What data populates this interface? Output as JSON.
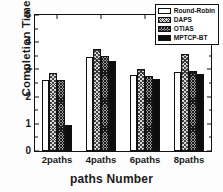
{
  "chart_data": {
    "type": "bar",
    "title": "",
    "xlabel": "paths Number",
    "ylabel": "Completion Time(ms)",
    "categories": [
      "2paths",
      "4paths",
      "6paths",
      "8paths"
    ],
    "ylim": [
      0,
      5
    ],
    "ytick_labels": [
      "0",
      "1",
      "2",
      "3",
      "4",
      "5"
    ],
    "ytick_values": [
      0,
      1,
      2,
      3,
      4,
      5
    ],
    "grid": false,
    "legend_position": "top-right-inside",
    "series": [
      {
        "name": "Round-Robin",
        "fill": "white",
        "values": [
          2.6,
          3.45,
          2.78,
          2.9
        ]
      },
      {
        "name": "DAPS",
        "fill": "light-crosshatch",
        "values": [
          2.85,
          3.75,
          3.0,
          3.55
        ]
      },
      {
        "name": "OTIAS",
        "fill": "dark-crosshatch",
        "values": [
          2.6,
          3.48,
          2.76,
          2.93
        ]
      },
      {
        "name": "MPTCP-BT",
        "fill": "solid-black",
        "values": [
          0.95,
          3.3,
          2.63,
          2.82
        ]
      }
    ]
  },
  "colors": {
    "axis": "#111111",
    "series_round_robin": "#ffffff",
    "series_daps": "#d8d8d8",
    "series_otias": "#9a9a9a",
    "series_mptcp_bt": "#0d0d0d",
    "background": "#ffffff"
  }
}
